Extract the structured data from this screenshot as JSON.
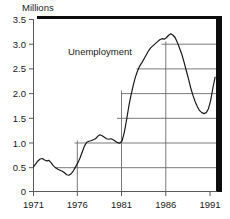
{
  "chart_data": {
    "type": "line",
    "title": "",
    "ylabel": "Millions",
    "xlabel": "",
    "annotation": "Unemployment",
    "grid": true,
    "legend_position": "inline-annotation",
    "xlim": [
      1971,
      1991.6
    ],
    "ylim": [
      0,
      3.5
    ],
    "xticks": [
      "1971",
      "1976",
      "1981",
      "1986",
      "1991"
    ],
    "xtick_values": [
      1971,
      1976,
      1981,
      1986,
      1991
    ],
    "yticks": [
      "0",
      "0.5",
      "1.0",
      "1.5",
      "2.0",
      "2.5",
      "3.0",
      "3.5"
    ],
    "ytick_values": [
      0,
      0.5,
      1.0,
      1.5,
      2.0,
      2.5,
      3.0,
      3.5
    ],
    "series": [
      {
        "name": "Unemployment",
        "color": "#1a1a1a",
        "x": [
          1971.0,
          1971.25,
          1971.5,
          1971.75,
          1972.0,
          1972.25,
          1972.5,
          1972.75,
          1973.0,
          1973.25,
          1973.5,
          1973.75,
          1974.0,
          1974.25,
          1974.5,
          1974.75,
          1975.0,
          1975.25,
          1975.5,
          1975.75,
          1976.0,
          1976.25,
          1976.5,
          1976.75,
          1977.0,
          1977.25,
          1977.5,
          1977.75,
          1978.0,
          1978.25,
          1978.5,
          1978.75,
          1979.0,
          1979.25,
          1979.5,
          1979.75,
          1980.0,
          1980.25,
          1980.5,
          1980.75,
          1981.0,
          1981.25,
          1981.5,
          1981.75,
          1982.0,
          1982.25,
          1982.5,
          1982.75,
          1983.0,
          1983.25,
          1983.5,
          1983.75,
          1984.0,
          1984.25,
          1984.5,
          1984.75,
          1985.0,
          1985.25,
          1985.5,
          1985.75,
          1986.0,
          1986.25,
          1986.5,
          1986.75,
          1987.0,
          1987.25,
          1987.5,
          1987.75,
          1988.0,
          1988.25,
          1988.5,
          1988.75,
          1989.0,
          1989.25,
          1989.5,
          1989.75,
          1990.0,
          1990.25,
          1990.5,
          1990.75,
          1991.0,
          1991.25,
          1991.5
        ],
        "y": [
          0.5,
          0.56,
          0.62,
          0.66,
          0.67,
          0.64,
          0.62,
          0.63,
          0.58,
          0.52,
          0.48,
          0.45,
          0.43,
          0.41,
          0.38,
          0.34,
          0.33,
          0.36,
          0.42,
          0.5,
          0.58,
          0.68,
          0.8,
          0.92,
          1.0,
          1.02,
          1.03,
          1.05,
          1.07,
          1.12,
          1.15,
          1.13,
          1.1,
          1.07,
          1.06,
          1.07,
          1.05,
          1.02,
          0.99,
          0.98,
          1.03,
          1.2,
          1.45,
          1.72,
          1.95,
          2.15,
          2.32,
          2.45,
          2.55,
          2.62,
          2.7,
          2.78,
          2.86,
          2.92,
          2.96,
          3.0,
          3.04,
          3.08,
          3.1,
          3.09,
          3.12,
          3.17,
          3.2,
          3.17,
          3.12,
          3.02,
          2.9,
          2.78,
          2.62,
          2.45,
          2.28,
          2.1,
          1.95,
          1.82,
          1.72,
          1.64,
          1.6,
          1.58,
          1.6,
          1.68,
          1.85,
          2.1,
          2.32
        ]
      }
    ]
  },
  "axes": {
    "unit_label": "Millions",
    "series_annotation": "Unemployment",
    "y_labels": [
      "3.5",
      "3.0",
      "2.5",
      "2.0",
      "1.5",
      "1.0",
      "0.5",
      "0"
    ],
    "x_labels": [
      "1971",
      "1976",
      "1981",
      "1986",
      "1991"
    ]
  },
  "style": {
    "line_color": "#1a1a1a",
    "grid_color": "#6b6b6b",
    "axis_color": "#5a5a5a",
    "shadow_color": "#0d0d0d",
    "plot_background": "#ffffff",
    "text_color": "#1a1a1a"
  }
}
